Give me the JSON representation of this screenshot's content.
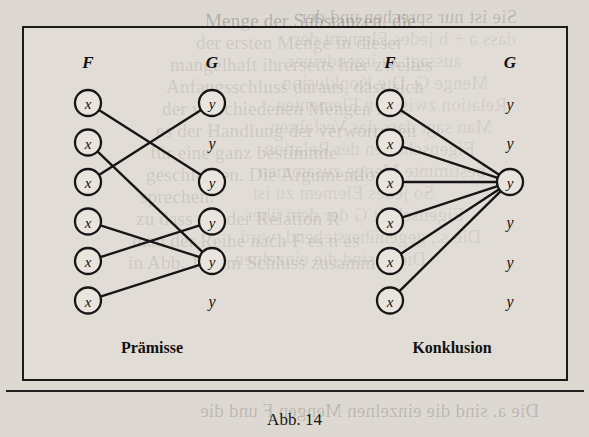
{
  "figure": {
    "caption": "Abb. 14",
    "panels": [
      {
        "id": "praemisse",
        "caption": "Prämisse",
        "left_header": "F",
        "right_header": "G",
        "left_nodes": [
          {
            "label": "x",
            "circled": true
          },
          {
            "label": "x",
            "circled": true
          },
          {
            "label": "x",
            "circled": true
          },
          {
            "label": "x",
            "circled": true
          },
          {
            "label": "x",
            "circled": true
          },
          {
            "label": "x",
            "circled": true
          }
        ],
        "right_nodes": [
          {
            "label": "y",
            "circled": true
          },
          {
            "label": "y",
            "circled": false
          },
          {
            "label": "y",
            "circled": true
          },
          {
            "label": "y",
            "circled": true
          },
          {
            "label": "y",
            "circled": true
          },
          {
            "label": "y",
            "circled": false
          }
        ],
        "edges": [
          {
            "from": 0,
            "to": 2
          },
          {
            "from": 1,
            "to": 4
          },
          {
            "from": 2,
            "to": 0
          },
          {
            "from": 3,
            "to": 4
          },
          {
            "from": 4,
            "to": 3
          },
          {
            "from": 5,
            "to": 4
          }
        ]
      },
      {
        "id": "konklusion",
        "caption": "Konklusion",
        "left_header": "F",
        "right_header": "G",
        "left_nodes": [
          {
            "label": "x",
            "circled": true
          },
          {
            "label": "x",
            "circled": true
          },
          {
            "label": "x",
            "circled": true
          },
          {
            "label": "x",
            "circled": true
          },
          {
            "label": "x",
            "circled": true
          },
          {
            "label": "x",
            "circled": true
          }
        ],
        "right_nodes": [
          {
            "label": "y",
            "circled": false
          },
          {
            "label": "y",
            "circled": false
          },
          {
            "label": "y",
            "circled": true
          },
          {
            "label": "y",
            "circled": false
          },
          {
            "label": "y",
            "circled": false
          },
          {
            "label": "y",
            "circled": false
          }
        ],
        "edges": [
          {
            "from": 0,
            "to": 2
          },
          {
            "from": 1,
            "to": 2
          },
          {
            "from": 2,
            "to": 2
          },
          {
            "from": 3,
            "to": 2
          },
          {
            "from": 4,
            "to": 2
          },
          {
            "from": 5,
            "to": 2
          }
        ]
      }
    ]
  },
  "colors": {
    "ink": "#161616",
    "page": "#ddd9d2",
    "node_fill": "#e9e5de"
  },
  "background_text": {
    "lines": [
      {
        "text": "Menge der Substanzen, die",
        "x": 205,
        "y": 10,
        "size": 19,
        "flip": false
      },
      {
        "text": "der ersten Menge in dieser",
        "x": 196,
        "y": 32,
        "size": 19,
        "flip": false
      },
      {
        "text": "mangelhaft ihrerseits hier zweites",
        "x": 170,
        "y": 54,
        "size": 19,
        "flip": false
      },
      {
        "text": "Anfangsschluss daraus, dass sich",
        "x": 166,
        "y": 76,
        "size": 19,
        "flip": false
      },
      {
        "text": "der verschiedenen Mengen Mit",
        "x": 162,
        "y": 98,
        "size": 19,
        "flip": false
      },
      {
        "text": "es der Handlung der verworrenen",
        "x": 156,
        "y": 120,
        "size": 19,
        "flip": false
      },
      {
        "text": "für eine ganz bestimmte",
        "x": 150,
        "y": 142,
        "size": 19,
        "flip": false
      },
      {
        "text": "geschlossen. Die Argumentform",
        "x": 146,
        "y": 164,
        "size": 19,
        "flip": false
      },
      {
        "text": "sprechen.",
        "x": 140,
        "y": 186,
        "size": 19,
        "flip": false
      },
      {
        "text": "zu dass ein der Relation R",
        "x": 136,
        "y": 208,
        "size": 19,
        "flip": false
      },
      {
        "text": "man der Reihe nach F es n es",
        "x": 132,
        "y": 230,
        "size": 19,
        "flip": false
      },
      {
        "text": "in Abb. 1 + im Schluss zusammen",
        "x": 128,
        "y": 252,
        "size": 19,
        "flip": false
      }
    ],
    "lines_flipped": [
      {
        "text": "Sie ist nur sprechen und der",
        "x": 300,
        "y": 6,
        "size": 19
      },
      {
        "text": "dass a + b jedes Element der",
        "x": 294,
        "y": 28,
        "size": 19
      },
      {
        "text": "aussagt zu irgendeiner",
        "x": 288,
        "y": 50,
        "size": 19
      },
      {
        "text": "Menge G. Die Konklusion",
        "x": 282,
        "y": 72,
        "size": 19
      },
      {
        "text": "Relation zwischen Elementen",
        "x": 276,
        "y": 94,
        "size": 19
      },
      {
        "text": "Man sagt dass das Verfahren",
        "x": 270,
        "y": 116,
        "size": 19
      },
      {
        "text": "Eigenschaften der Relation",
        "x": 264,
        "y": 138,
        "size": 19
      },
      {
        "text": "bestimmte Menge zusammen",
        "x": 258,
        "y": 160,
        "size": 19
      },
      {
        "text": "So jedes Element zu ist",
        "x": 252,
        "y": 182,
        "size": 19
      },
      {
        "text": "Eigenschaft G der dem über",
        "x": 246,
        "y": 204,
        "size": 19
      },
      {
        "text": "Die s., gegenüberstehend, wird",
        "x": 240,
        "y": 226,
        "size": 19
      },
      {
        "text": "Die a. sind die einzelnen",
        "x": 234,
        "y": 248,
        "size": 19
      },
      {
        "text": "Die a. sind die einzelnen Mengen F und die",
        "x": 200,
        "y": 400,
        "size": 19
      }
    ]
  }
}
